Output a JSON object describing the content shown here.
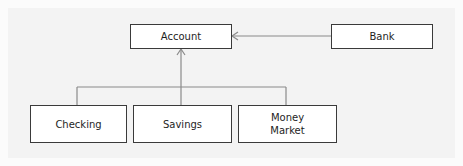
{
  "diagram": {
    "type": "class-hierarchy",
    "nodes": [
      {
        "id": "account",
        "label": "Account"
      },
      {
        "id": "bank",
        "label": "Bank"
      },
      {
        "id": "checking",
        "label": "Checking"
      },
      {
        "id": "savings",
        "label": "Savings"
      },
      {
        "id": "money_market",
        "label": "Money\nMarket"
      }
    ],
    "edges": [
      {
        "from": "bank",
        "to": "account",
        "style": "open-arrow"
      },
      {
        "from": "checking",
        "to": "account",
        "style": "open-arrow",
        "routing": "shared-trunk"
      },
      {
        "from": "savings",
        "to": "account",
        "style": "open-arrow",
        "routing": "shared-trunk"
      },
      {
        "from": "money_market",
        "to": "account",
        "style": "open-arrow",
        "routing": "shared-trunk"
      }
    ],
    "colors": {
      "box_border": "#3a3a3a",
      "connector": "#8a8a8a",
      "panel_bg": "#f3f3f3",
      "page_bg": "#fbfbfb"
    }
  }
}
